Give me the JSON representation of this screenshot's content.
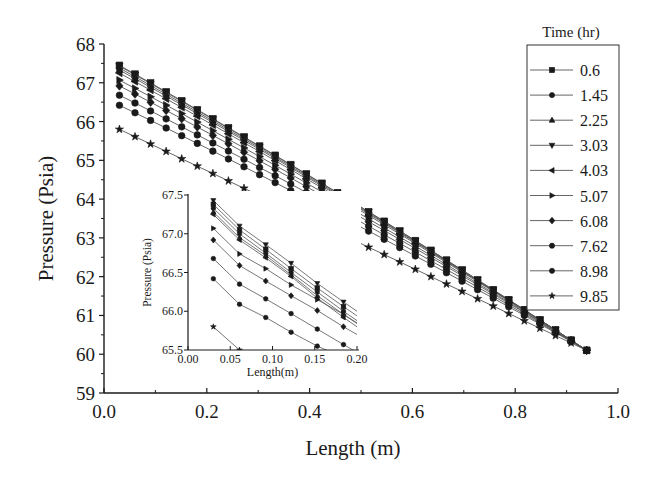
{
  "chart_data": [
    {
      "type": "line",
      "title": "",
      "xlabel": "Length (m)",
      "ylabel": "Pressure (Psia)",
      "xlim": [
        0.0,
        1.0
      ],
      "ylim": [
        59,
        68
      ],
      "xticks": [
        "0.0",
        "0.2",
        "0.4",
        "0.6",
        "0.8",
        "1.0"
      ],
      "yticks": [
        "59",
        "60",
        "61",
        "62",
        "63",
        "64",
        "65",
        "66",
        "67",
        "68"
      ],
      "grid": false,
      "legend": {
        "title": "Time (hr)",
        "position": "right-outside-top",
        "entries": [
          {
            "label": "0.6",
            "marker": "square"
          },
          {
            "label": "1.45",
            "marker": "circle"
          },
          {
            "label": "2.25",
            "marker": "triangle-up"
          },
          {
            "label": "3.03",
            "marker": "triangle-down"
          },
          {
            "label": "4.03",
            "marker": "triangle-left"
          },
          {
            "label": "5.07",
            "marker": "triangle-right"
          },
          {
            "label": "6.08",
            "marker": "diamond"
          },
          {
            "label": "7.62",
            "marker": "hexagon"
          },
          {
            "label": "8.98",
            "marker": "circle"
          },
          {
            "label": "9.85",
            "marker": "star"
          }
        ]
      },
      "x_start": 0.03,
      "x_step": 0.0303,
      "n_points": 31,
      "series": [
        {
          "name": "0.6",
          "start": 67.45,
          "end": 60.1
        },
        {
          "name": "1.45",
          "start": 67.38,
          "end": 60.1
        },
        {
          "name": "2.25",
          "start": 67.33,
          "end": 60.1
        },
        {
          "name": "3.03",
          "start": 67.43,
          "end": 60.1
        },
        {
          "name": "4.03",
          "start": 67.25,
          "end": 60.1
        },
        {
          "name": "5.07",
          "start": 67.07,
          "end": 60.1
        },
        {
          "name": "6.08",
          "start": 66.92,
          "end": 60.1
        },
        {
          "name": "7.62",
          "start": 66.68,
          "end": 60.1
        },
        {
          "name": "8.98",
          "start": 66.42,
          "end": 60.1
        },
        {
          "name": "9.85",
          "start": 65.8,
          "end": 60.1
        }
      ]
    },
    {
      "type": "line",
      "title": "inset",
      "xlabel": "Length(m)",
      "ylabel": "Pressure (Psia)",
      "xlim": [
        0.0,
        0.2
      ],
      "ylim": [
        65.5,
        67.5
      ],
      "xticks": [
        "0.00",
        "0.05",
        "0.10",
        "0.15",
        "0.20"
      ],
      "yticks": [
        "65.5",
        "66.0",
        "66.5",
        "67.0",
        "67.5"
      ],
      "x": [
        0.03,
        0.061,
        0.092,
        0.122,
        0.153,
        0.184,
        0.2
      ],
      "series": [
        {
          "name": "3.03",
          "values": [
            67.43,
            67.1,
            66.86,
            66.62,
            66.36,
            66.12,
            66.0
          ]
        },
        {
          "name": "0.6",
          "values": [
            67.38,
            67.05,
            66.8,
            66.55,
            66.3,
            66.06,
            65.94
          ]
        },
        {
          "name": "1.45",
          "values": [
            67.33,
            67.0,
            66.75,
            66.5,
            66.25,
            66.0,
            65.88
          ]
        },
        {
          "name": "2.25",
          "values": [
            67.28,
            66.95,
            66.72,
            66.47,
            66.2,
            65.96,
            65.84
          ]
        },
        {
          "name": "4.03",
          "values": [
            67.25,
            66.92,
            66.69,
            66.45,
            66.17,
            65.92,
            65.8
          ]
        },
        {
          "name": "5.07",
          "values": [
            67.07,
            66.74,
            66.55,
            66.34,
            66.15,
            65.96,
            65.85
          ]
        },
        {
          "name": "6.08",
          "values": [
            66.92,
            66.59,
            66.39,
            66.2,
            66.01,
            65.8,
            65.7
          ]
        },
        {
          "name": "7.62",
          "values": [
            66.68,
            66.35,
            66.16,
            65.97,
            65.77,
            65.57,
            65.47
          ]
        },
        {
          "name": "8.98",
          "values": [
            66.42,
            66.09,
            65.92,
            65.73,
            65.55,
            65.4,
            65.3
          ]
        },
        {
          "name": "9.85",
          "values": [
            65.8,
            65.5,
            65.2,
            65.0,
            64.8,
            64.6,
            64.5
          ]
        }
      ]
    }
  ]
}
